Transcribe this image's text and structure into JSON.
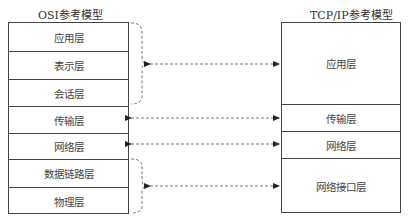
{
  "osi": {
    "title": "OSI参考模型",
    "layers": [
      "应用层",
      "表示层",
      "会话层",
      "传输层",
      "网络层",
      "数据链路层",
      "物理层"
    ]
  },
  "tcpip": {
    "title": "TCP/IP参考模型",
    "layers": [
      "应用层",
      "传输层",
      "网络层",
      "网络接口层"
    ]
  },
  "mappings": [
    {
      "osi": [
        "应用层",
        "表示层",
        "会话层"
      ],
      "tcpip": "应用层"
    },
    {
      "osi": [
        "传输层"
      ],
      "tcpip": "传输层"
    },
    {
      "osi": [
        "网络层"
      ],
      "tcpip": "网络层"
    },
    {
      "osi": [
        "数据链路层",
        "物理层"
      ],
      "tcpip": "网络接口层"
    }
  ]
}
